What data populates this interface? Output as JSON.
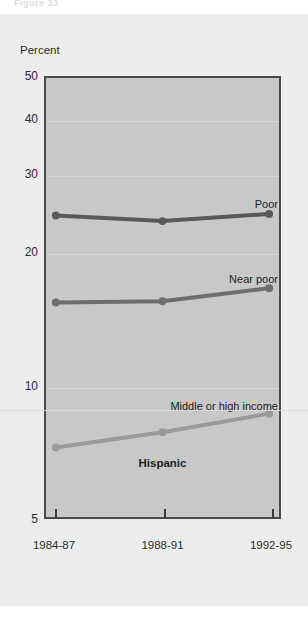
{
  "figure": {
    "number_text": "Figure 33",
    "group_label": "Hispanic"
  },
  "chart_data": {
    "type": "line",
    "title": "",
    "subtitle": "",
    "xlabel": "",
    "ylabel": "Percent",
    "x": [
      "1984-87",
      "1988-91",
      "1992-95"
    ],
    "categories": [
      "1984-87",
      "1988-91",
      "1992-95"
    ],
    "yticks": [
      5,
      10,
      20,
      30,
      40,
      50
    ],
    "ytick_labels": [
      "5",
      "10",
      "20",
      "30",
      "40",
      "50"
    ],
    "ylim": [
      5,
      50
    ],
    "yscale": "log",
    "grid": true,
    "legend_position": "inline-right",
    "annotations": [
      "Hispanic"
    ],
    "series": [
      {
        "name": "Poor",
        "label": "Poor",
        "color": "#595959",
        "values": [
          24.3,
          23.6,
          24.5
        ]
      },
      {
        "name": "Near poor",
        "label": "Near poor",
        "color": "#6e6e6e",
        "values": [
          15.4,
          15.5,
          16.6
        ]
      },
      {
        "name": "Middle or high income",
        "label": "Middle or high income",
        "color": "#9a9a9a",
        "values": [
          7.2,
          7.8,
          8.6
        ]
      }
    ]
  },
  "colors": {
    "panel_background": "#eceded",
    "plot_background": "#c8c8c8",
    "plot_border": "#4a4a4a",
    "gridline": "#d6d6d6",
    "text": "#2b2b2b"
  }
}
